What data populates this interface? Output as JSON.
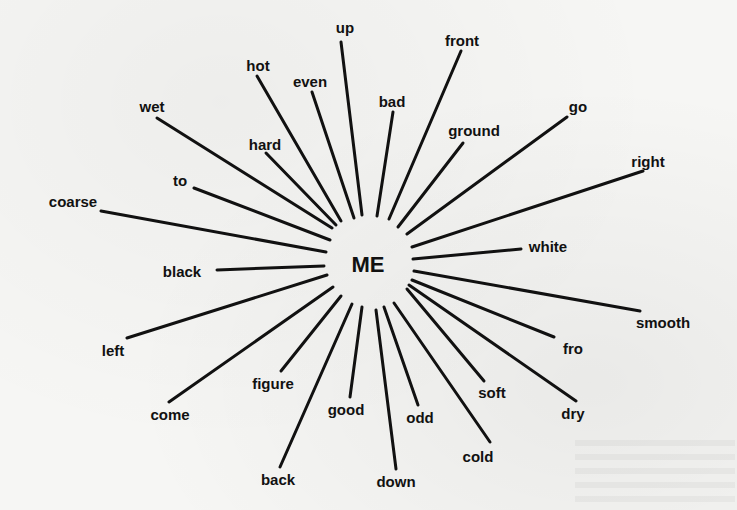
{
  "diagram": {
    "type": "radial-word-association",
    "center": {
      "label": "ME",
      "x": 368,
      "y": 265
    },
    "words": [
      {
        "id": "up",
        "label": "up",
        "lx": 345,
        "ly": 27,
        "x1": 341,
        "y1": 42,
        "x2": 362,
        "y2": 215
      },
      {
        "id": "front",
        "label": "front",
        "lx": 462,
        "ly": 40,
        "x1": 461,
        "y1": 51,
        "x2": 389,
        "y2": 219
      },
      {
        "id": "hot",
        "label": "hot",
        "lx": 258,
        "ly": 65,
        "x1": 257,
        "y1": 76,
        "x2": 341,
        "y2": 221
      },
      {
        "id": "even",
        "label": "even",
        "lx": 310,
        "ly": 81,
        "x1": 312,
        "y1": 92,
        "x2": 354,
        "y2": 218
      },
      {
        "id": "bad",
        "label": "bad",
        "lx": 392,
        "ly": 101,
        "x1": 393,
        "y1": 112,
        "x2": 377,
        "y2": 216
      },
      {
        "id": "go",
        "label": "go",
        "lx": 578,
        "ly": 106,
        "x1": 567,
        "y1": 117,
        "x2": 407,
        "y2": 234
      },
      {
        "id": "wet",
        "label": "wet",
        "lx": 152,
        "ly": 106,
        "x1": 157,
        "y1": 118,
        "x2": 332,
        "y2": 228
      },
      {
        "id": "ground",
        "label": "ground",
        "lx": 474,
        "ly": 130,
        "x1": 463,
        "y1": 143,
        "x2": 398,
        "y2": 227
      },
      {
        "id": "hard",
        "label": "hard",
        "lx": 265,
        "ly": 144,
        "x1": 266,
        "y1": 153,
        "x2": 336,
        "y2": 225
      },
      {
        "id": "right",
        "label": "right",
        "lx": 648,
        "ly": 161,
        "x1": 643,
        "y1": 171,
        "x2": 412,
        "y2": 247
      },
      {
        "id": "to",
        "label": "to",
        "lx": 180,
        "ly": 180,
        "x1": 194,
        "y1": 188,
        "x2": 330,
        "y2": 240
      },
      {
        "id": "coarse",
        "label": "coarse",
        "lx": 73,
        "ly": 201,
        "x1": 101,
        "y1": 211,
        "x2": 326,
        "y2": 252
      },
      {
        "id": "white",
        "label": "white",
        "lx": 548,
        "ly": 246,
        "x1": 521,
        "y1": 249,
        "x2": 413,
        "y2": 259
      },
      {
        "id": "black",
        "label": "black",
        "lx": 182,
        "ly": 271,
        "x1": 217,
        "y1": 270,
        "x2": 324,
        "y2": 266
      },
      {
        "id": "smooth",
        "label": "smooth",
        "lx": 663,
        "ly": 322,
        "x1": 640,
        "y1": 311,
        "x2": 414,
        "y2": 271
      },
      {
        "id": "left",
        "label": "left",
        "lx": 113,
        "ly": 350,
        "x1": 127,
        "y1": 338,
        "x2": 327,
        "y2": 275
      },
      {
        "id": "fro",
        "label": "fro",
        "lx": 573,
        "ly": 348,
        "x1": 554,
        "y1": 337,
        "x2": 412,
        "y2": 280
      },
      {
        "id": "figure",
        "label": "figure",
        "lx": 273,
        "ly": 383,
        "x1": 281,
        "y1": 371,
        "x2": 341,
        "y2": 296
      },
      {
        "id": "come",
        "label": "come",
        "lx": 170,
        "ly": 414,
        "x1": 169,
        "y1": 402,
        "x2": 333,
        "y2": 287
      },
      {
        "id": "soft",
        "label": "soft",
        "lx": 492,
        "ly": 392,
        "x1": 484,
        "y1": 381,
        "x2": 407,
        "y2": 289
      },
      {
        "id": "dry",
        "label": "dry",
        "lx": 573,
        "ly": 413,
        "x1": 576,
        "y1": 401,
        "x2": 409,
        "y2": 285
      },
      {
        "id": "good",
        "label": "good",
        "lx": 346,
        "ly": 409,
        "x1": 350,
        "y1": 397,
        "x2": 362,
        "y2": 307
      },
      {
        "id": "odd",
        "label": "odd",
        "lx": 420,
        "ly": 417,
        "x1": 418,
        "y1": 405,
        "x2": 384,
        "y2": 307
      },
      {
        "id": "cold",
        "label": "cold",
        "lx": 478,
        "ly": 456,
        "x1": 490,
        "y1": 442,
        "x2": 394,
        "y2": 303
      },
      {
        "id": "back",
        "label": "back",
        "lx": 278,
        "ly": 479,
        "x1": 280,
        "y1": 467,
        "x2": 352,
        "y2": 304
      },
      {
        "id": "down",
        "label": "down",
        "lx": 396,
        "ly": 481,
        "x1": 396,
        "y1": 469,
        "x2": 376,
        "y2": 310
      }
    ]
  }
}
